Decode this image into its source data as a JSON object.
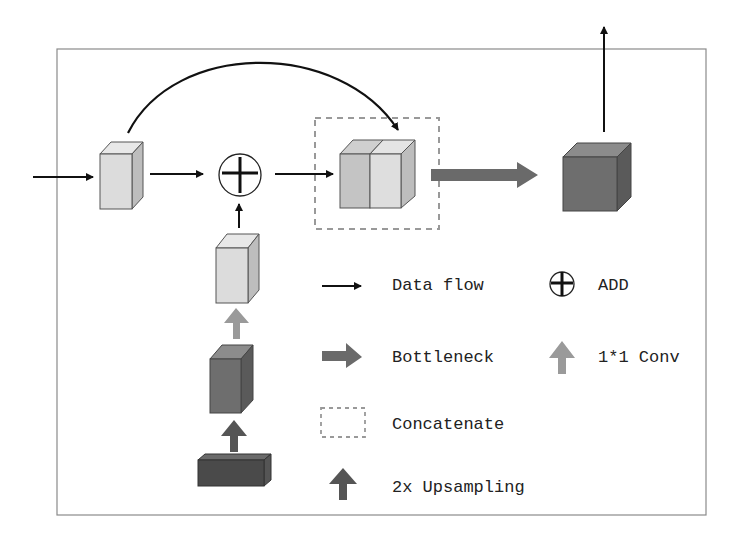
{
  "diagram": {
    "frame": {
      "x": 57,
      "y": 49,
      "w": 649,
      "h": 466,
      "stroke": "#8a8a8a"
    },
    "colors": {
      "light_cube_front": "#dcdcdc",
      "light_cube_top": "#e8e8e8",
      "light_cube_side": "#bdbdbd",
      "mid_cube_front": "#c4c4c4",
      "dark_cube_front": "#6e6e6e",
      "dark_cube_top": "#8c8c8c",
      "dark_cube_side": "#5a5a5a",
      "darkest_front": "#4a4a4a",
      "bottleneck_arrow": "#6a6a6a",
      "conv_arrow": "#9a9a9a",
      "upsample_arrow": "#555555",
      "dashed": "#999999",
      "line": "#111111"
    },
    "nodes": [
      {
        "id": "input-feature",
        "kind": "light-cube"
      },
      {
        "id": "add-node",
        "kind": "add"
      },
      {
        "id": "concat-block",
        "kind": "concat"
      },
      {
        "id": "output-feature",
        "kind": "dark-cube"
      },
      {
        "id": "conv-feature",
        "kind": "light-cube"
      },
      {
        "id": "upsampled-feature",
        "kind": "dark-cube"
      },
      {
        "id": "low-res-feature",
        "kind": "flat-dark"
      }
    ]
  },
  "legend": {
    "items": [
      {
        "symbol": "thin-arrow",
        "label": "Data flow"
      },
      {
        "symbol": "add-circle",
        "label": "ADD"
      },
      {
        "symbol": "bottleneck-arrow",
        "label": "Bottleneck"
      },
      {
        "symbol": "conv-arrow",
        "label": "1*1 Conv"
      },
      {
        "symbol": "dashed-box",
        "label": "Concatenate"
      },
      {
        "symbol": "upsample-arrow",
        "label": "2x Upsampling"
      }
    ]
  }
}
